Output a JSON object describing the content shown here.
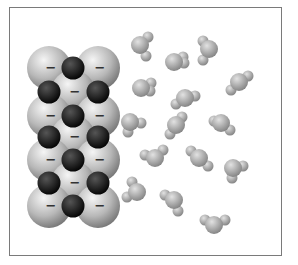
{
  "figure": {
    "frame": {
      "x": 9,
      "y": 7,
      "width": 273,
      "height": 249,
      "border_color": "#7a7a7a"
    }
  },
  "colors": {
    "anion_light": "#f5f5f5",
    "anion_mid": "#b8b8b8",
    "anion_dark": "#6e6e6e",
    "cation_light": "#555555",
    "cation_dark": "#050505",
    "water_light": "#e2e2e2",
    "water_dark": "#7d7d7d",
    "minus_sign": "#333333"
  },
  "lattice": {
    "anion_label": "−",
    "anion_radius": 22,
    "cation_radius": 11.5,
    "anions": [
      {
        "x": 49,
        "y": 68
      },
      {
        "x": 98,
        "y": 68
      },
      {
        "x": 73,
        "y": 92
      },
      {
        "x": 49,
        "y": 116
      },
      {
        "x": 98,
        "y": 116
      },
      {
        "x": 73,
        "y": 137
      },
      {
        "x": 49,
        "y": 160
      },
      {
        "x": 98,
        "y": 160
      },
      {
        "x": 73,
        "y": 183
      },
      {
        "x": 49,
        "y": 206
      },
      {
        "x": 98,
        "y": 206
      }
    ],
    "cations": [
      {
        "x": 73,
        "y": 68
      },
      {
        "x": 49,
        "y": 92
      },
      {
        "x": 98,
        "y": 92
      },
      {
        "x": 73,
        "y": 116
      },
      {
        "x": 49,
        "y": 137
      },
      {
        "x": 98,
        "y": 137
      },
      {
        "x": 73,
        "y": 160
      },
      {
        "x": 49,
        "y": 183
      },
      {
        "x": 98,
        "y": 183
      },
      {
        "x": 73,
        "y": 206
      }
    ]
  },
  "water": {
    "o_radius": 9,
    "h_radius": 5.5,
    "molecules": [
      {
        "o": [
          140,
          45
        ],
        "h": [
          [
            148,
            37
          ],
          [
            146,
            56
          ]
        ]
      },
      {
        "o": [
          174,
          62
        ],
        "h": [
          [
            183,
            57
          ],
          [
            184,
            63
          ]
        ]
      },
      {
        "o": [
          209,
          49
        ],
        "h": [
          [
            203,
            41
          ],
          [
            203,
            60
          ]
        ]
      },
      {
        "o": [
          239,
          82
        ],
        "h": [
          [
            248,
            76
          ],
          [
            231,
            90
          ]
        ]
      },
      {
        "o": [
          141,
          88
        ],
        "h": [
          [
            151,
            83
          ],
          [
            150,
            91
          ]
        ]
      },
      {
        "o": [
          185,
          98
        ],
        "h": [
          [
            176,
            104
          ],
          [
            195,
            96
          ]
        ]
      },
      {
        "o": [
          130,
          122
        ],
        "h": [
          [
            141,
            123
          ],
          [
            128,
            132
          ]
        ]
      },
      {
        "o": [
          176,
          125
        ],
        "h": [
          [
            170,
            134
          ],
          [
            182,
            117
          ]
        ]
      },
      {
        "o": [
          221,
          123
        ],
        "h": [
          [
            214,
            121
          ],
          [
            230,
            130
          ]
        ]
      },
      {
        "o": [
          155,
          158
        ],
        "h": [
          [
            145,
            155
          ],
          [
            163,
            150
          ]
        ]
      },
      {
        "o": [
          199,
          158
        ],
        "h": [
          [
            191,
            151
          ],
          [
            208,
            166
          ]
        ]
      },
      {
        "o": [
          233,
          168
        ],
        "h": [
          [
            243,
            166
          ],
          [
            232,
            178
          ]
        ]
      },
      {
        "o": [
          137,
          192
        ],
        "h": [
          [
            132,
            182
          ],
          [
            127,
            197
          ]
        ]
      },
      {
        "o": [
          174,
          200
        ],
        "h": [
          [
            165,
            195
          ],
          [
            178,
            211
          ]
        ]
      },
      {
        "o": [
          214,
          225
        ],
        "h": [
          [
            205,
            220
          ],
          [
            225,
            220
          ]
        ]
      }
    ]
  }
}
